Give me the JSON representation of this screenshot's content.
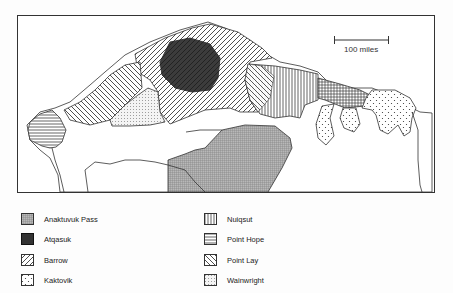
{
  "map": {
    "scale_bar": {
      "label": "100 miles"
    },
    "regions": [
      {
        "community": "Anaktuvuk Pass",
        "pattern": "fine-crosshatch-gray"
      },
      {
        "community": "Atqasuk",
        "pattern": "solid-dark-hatched"
      },
      {
        "community": "Barrow",
        "pattern": "diagonal-forward"
      },
      {
        "community": "Kaktovik",
        "pattern": "sparse-dots"
      },
      {
        "community": "Nuiqsut",
        "pattern": "vertical-lines"
      },
      {
        "community": "Point Hope",
        "pattern": "horizontal-lines"
      },
      {
        "community": "Point Lay",
        "pattern": "diagonal-backward"
      },
      {
        "community": "Wainwright",
        "pattern": "fine-dots"
      }
    ]
  },
  "legend": {
    "left": [
      {
        "label": "Anaktuvuk Pass",
        "pattern": "cross"
      },
      {
        "label": "Atqasuk",
        "pattern": "dark"
      },
      {
        "label": "Barrow",
        "pattern": "fwd"
      },
      {
        "label": "Kaktovik",
        "pattern": "sparsedots"
      }
    ],
    "right": [
      {
        "label": "Nuiqsut",
        "pattern": "vert"
      },
      {
        "label": "Point Hope",
        "pattern": "horiz"
      },
      {
        "label": "Point Lay",
        "pattern": "back"
      },
      {
        "label": "Wainwright",
        "pattern": "finedots"
      }
    ]
  },
  "colors": {
    "line": "#222222",
    "atqasuk_fill": "#1a1a1a",
    "anaktuvuk_fill": "#a0a0a0"
  }
}
